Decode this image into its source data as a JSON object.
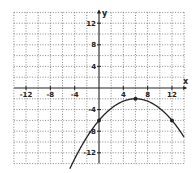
{
  "chart_data": {
    "type": "line",
    "title": "",
    "xlabel": "x",
    "ylabel": "y",
    "xlim": [
      -14,
      14
    ],
    "ylim": [
      -14,
      14
    ],
    "grid": true,
    "grid_step": 2,
    "x_ticks": [
      -12,
      -8,
      -4,
      4,
      8,
      12
    ],
    "y_ticks": [
      12,
      8,
      4,
      -4,
      -8,
      -12
    ],
    "series": [
      {
        "name": "parabola",
        "equation": "y = -(1/9)(x - 6)^2 - 2",
        "x_range": [
          -4.8,
          14
        ],
        "marked_points": [
          {
            "x": 0,
            "y": -6
          },
          {
            "x": 6,
            "y": -2
          },
          {
            "x": 12,
            "y": -6
          }
        ]
      }
    ]
  },
  "labels": {
    "x_axis": "x",
    "y_axis": "y",
    "x_ticks": [
      "-12",
      "-8",
      "-4",
      "4",
      "8",
      "12"
    ],
    "y_ticks": [
      "12",
      "8",
      "4",
      "-4",
      "-8",
      "-12"
    ]
  }
}
